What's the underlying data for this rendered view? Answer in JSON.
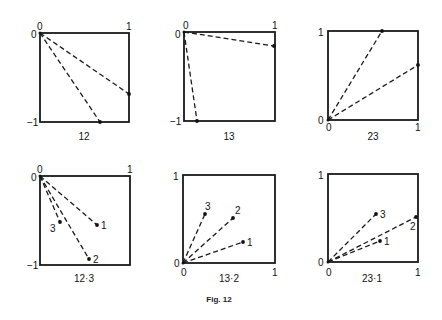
{
  "figure_caption": "Fig. 12",
  "panels": [
    {
      "caption": "12",
      "box": {
        "x": 40,
        "y": 33,
        "w": 89,
        "h": 89
      },
      "corner_labels": [
        {
          "text": "0",
          "x": 31,
          "y": 38
        },
        {
          "text": "0",
          "x": 37,
          "y": 30
        },
        {
          "text": "1",
          "x": 126,
          "y": 30
        },
        {
          "text": "−1",
          "x": 27,
          "y": 126
        }
      ],
      "origin": {
        "x": 40,
        "y": 33
      },
      "points": [
        {
          "x": 129,
          "y": 94,
          "label": ""
        },
        {
          "x": 100,
          "y": 122,
          "label": ""
        }
      ],
      "caption_pos": {
        "x": 84,
        "y": 140
      }
    },
    {
      "caption": "13",
      "box": {
        "x": 184,
        "y": 32,
        "w": 91,
        "h": 89
      },
      "corner_labels": [
        {
          "text": "0",
          "x": 175,
          "y": 38
        },
        {
          "text": "0",
          "x": 183,
          "y": 29
        },
        {
          "text": "1",
          "x": 272,
          "y": 29
        },
        {
          "text": "−1",
          "x": 170,
          "y": 125
        }
      ],
      "origin": {
        "x": 184,
        "y": 32
      },
      "points": [
        {
          "x": 274,
          "y": 46,
          "label": ""
        },
        {
          "x": 197,
          "y": 121,
          "label": ""
        }
      ],
      "caption_pos": {
        "x": 229,
        "y": 140
      }
    },
    {
      "caption": "23",
      "box": {
        "x": 328,
        "y": 31,
        "w": 90,
        "h": 89
      },
      "corner_labels": [
        {
          "text": "1",
          "x": 318,
          "y": 36
        },
        {
          "text": "0",
          "x": 318,
          "y": 124
        },
        {
          "text": "0",
          "x": 326,
          "y": 131
        },
        {
          "text": "1",
          "x": 415,
          "y": 131
        }
      ],
      "origin": {
        "x": 328,
        "y": 120
      },
      "points": [
        {
          "x": 382,
          "y": 31,
          "label": ""
        },
        {
          "x": 418,
          "y": 65,
          "label": ""
        }
      ],
      "caption_pos": {
        "x": 373,
        "y": 140
      }
    },
    {
      "caption": "12·3",
      "box": {
        "x": 40,
        "y": 176,
        "w": 90,
        "h": 89
      },
      "corner_labels": [
        {
          "text": "0",
          "x": 31,
          "y": 181
        },
        {
          "text": "0",
          "x": 37,
          "y": 173
        },
        {
          "text": "1",
          "x": 127,
          "y": 173
        },
        {
          "text": "−1",
          "x": 27,
          "y": 269
        }
      ],
      "origin": {
        "x": 40,
        "y": 176
      },
      "points": [
        {
          "x": 97,
          "y": 225,
          "label": "1",
          "lx": 101,
          "ly": 229
        },
        {
          "x": 89,
          "y": 259,
          "label": "2",
          "lx": 93,
          "ly": 263
        },
        {
          "x": 60,
          "y": 222,
          "label": "3",
          "lx": 50,
          "ly": 232
        }
      ],
      "caption_pos": {
        "x": 84,
        "y": 282
      }
    },
    {
      "caption": "13·2",
      "box": {
        "x": 183,
        "y": 175,
        "w": 92,
        "h": 88
      },
      "corner_labels": [
        {
          "text": "1",
          "x": 173,
          "y": 180
        },
        {
          "text": "0",
          "x": 174,
          "y": 267
        },
        {
          "text": "0",
          "x": 181,
          "y": 276
        },
        {
          "text": "1",
          "x": 272,
          "y": 276
        }
      ],
      "origin": {
        "x": 183,
        "y": 263
      },
      "points": [
        {
          "x": 243,
          "y": 242,
          "label": "1",
          "lx": 247,
          "ly": 246
        },
        {
          "x": 233,
          "y": 218,
          "label": "2",
          "lx": 235,
          "ly": 214
        },
        {
          "x": 205,
          "y": 214,
          "label": "3",
          "lx": 205,
          "ly": 210
        }
      ],
      "caption_pos": {
        "x": 229,
        "y": 282
      }
    },
    {
      "caption": "23·1",
      "box": {
        "x": 328,
        "y": 174,
        "w": 90,
        "h": 88
      },
      "corner_labels": [
        {
          "text": "1",
          "x": 318,
          "y": 179
        },
        {
          "text": "0",
          "x": 318,
          "y": 266
        },
        {
          "text": "0",
          "x": 326,
          "y": 276
        },
        {
          "text": "1",
          "x": 415,
          "y": 276
        }
      ],
      "origin": {
        "x": 328,
        "y": 262
      },
      "points": [
        {
          "x": 380,
          "y": 241,
          "label": "1",
          "lx": 384,
          "ly": 245
        },
        {
          "x": 416,
          "y": 217,
          "label": "2",
          "lx": 410,
          "ly": 230
        },
        {
          "x": 376,
          "y": 214,
          "label": "3",
          "lx": 380,
          "ly": 218
        }
      ],
      "caption_pos": {
        "x": 372,
        "y": 282
      }
    }
  ],
  "figure_caption_pos": {
    "x": 219,
    "y": 302
  }
}
